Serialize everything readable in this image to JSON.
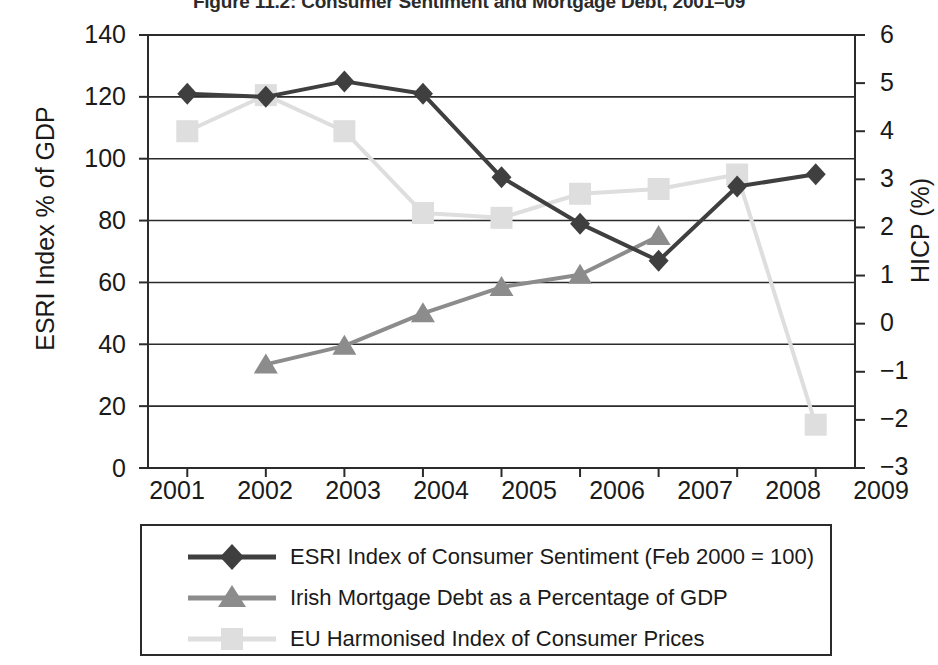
{
  "figure": {
    "title": "Figure 11.2: Consumer Sentiment and Mortgage Debt, 2001–09"
  },
  "axes": {
    "left": {
      "label": "ESRI Index % of GDP",
      "ticks": [
        "0",
        "20",
        "40",
        "60",
        "80",
        "100",
        "120",
        "140"
      ],
      "min": 0,
      "max": 140
    },
    "right": {
      "label": "HICP (%)",
      "ticks": [
        "−3",
        "−2",
        "−1",
        "0",
        "1",
        "2",
        "3",
        "4",
        "5",
        "6"
      ],
      "min": -3,
      "max": 6
    },
    "bottom": {
      "ticks": [
        "2001",
        "2002",
        "2003",
        "2004",
        "2005",
        "2006",
        "2007",
        "2008",
        "2009"
      ]
    }
  },
  "legend": {
    "items": [
      {
        "label": "ESRI Index of Consumer Sentiment (Feb 2000 = 100)",
        "marker": "diamond-marker",
        "color": "#3f3f3f"
      },
      {
        "label": "Irish Mortgage Debt as a Percentage of GDP",
        "marker": "triangle-marker",
        "color": "#8c8c8c"
      },
      {
        "label": "EU Harmonised Index of Consumer Prices",
        "marker": "square-marker",
        "color": "#dedede"
      }
    ]
  },
  "colors": {
    "esri": "#3f3f3f",
    "mortgage": "#8c8c8c",
    "hicp": "#dedede",
    "axis": "#2b2b2b",
    "grid": "#2b2b2b",
    "background": "#ffffff"
  },
  "chart_data": {
    "type": "line",
    "title": "Figure 11.2: Consumer Sentiment and Mortgage Debt, 2001–09",
    "xlabel": "",
    "ylabel": "ESRI Index % of GDP",
    "y2label": "HICP (%)",
    "x": [
      "2001",
      "2002",
      "2003",
      "2004",
      "2005",
      "2006",
      "2007",
      "2008",
      "2009"
    ],
    "ylim": [
      0,
      140
    ],
    "y2lim": [
      -3,
      6
    ],
    "ytick_step": 20,
    "y2tick_step": 1,
    "grid": true,
    "legend_position": "below-plot",
    "series": [
      {
        "name": "ESRI Index of Consumer Sentiment (Feb 2000 = 100)",
        "axis": "left",
        "marker": "diamond",
        "color": "#3f3f3f",
        "x": [
          "2001",
          "2002",
          "2003",
          "2004",
          "2005",
          "2006",
          "2007",
          "2008",
          "2009"
        ],
        "values": [
          121,
          120,
          125,
          121,
          94,
          79,
          67,
          91,
          95
        ]
      },
      {
        "name": "Irish Mortgage Debt as a Percentage of GDP",
        "axis": "left",
        "marker": "triangle",
        "color": "#8c8c8c",
        "x": [
          "2002",
          "2003",
          "2004",
          "2005",
          "2006",
          "2007"
        ],
        "values": [
          33.5,
          39.5,
          50,
          58.5,
          62.5,
          75
        ]
      },
      {
        "name": "EU Harmonised Index of Consumer Prices",
        "axis": "right",
        "marker": "square",
        "color": "#dedede",
        "x": [
          "2001",
          "2002",
          "2003",
          "2004",
          "2005",
          "2006",
          "2007",
          "2008",
          "2009"
        ],
        "values": [
          4.0,
          4.75,
          4.0,
          2.3,
          2.2,
          2.7,
          2.8,
          3.1,
          -2.1
        ]
      }
    ]
  }
}
